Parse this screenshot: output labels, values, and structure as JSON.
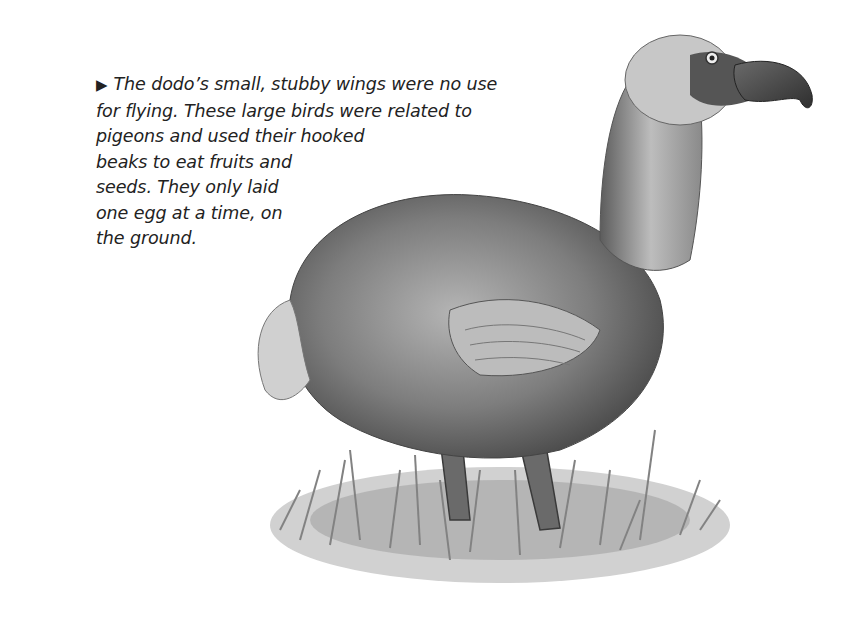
{
  "caption": {
    "bullet": "▶",
    "lines": [
      "The dodo’s small, stubby wings were no use",
      "for flying. These large birds were related to",
      "pigeons and used their hooked",
      "beaks to eat fruits and",
      "seeds. They only laid",
      "one egg at a time, on",
      "the ground."
    ]
  },
  "illustration": {
    "subject": "dodo-bird",
    "style": "pencil sketch",
    "colors": {
      "body": "#7a7a7a",
      "dark": "#3a3a3a",
      "light": "#cfcfcf",
      "grass": "#8c8c8c"
    }
  }
}
